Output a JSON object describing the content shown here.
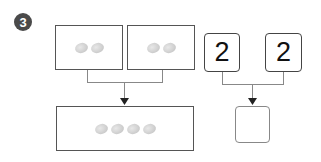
{
  "exercise": {
    "number": "3",
    "badge_color": "#4a4a4a"
  },
  "picture_group": {
    "left_box": {
      "coin_count": 2
    },
    "right_box": {
      "coin_count": 2
    },
    "result_box": {
      "coin_count": 4
    }
  },
  "number_group": {
    "left_value": "2",
    "right_value": "2",
    "answer_value": ""
  },
  "icons": {
    "coin": "coin-icon",
    "arrow": "arrow-down-icon"
  }
}
